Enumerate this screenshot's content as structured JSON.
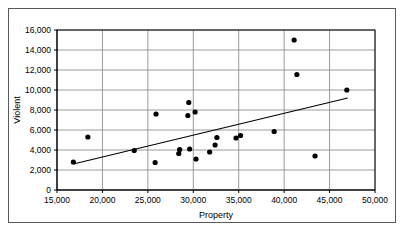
{
  "chart_data": {
    "type": "scatter",
    "title": "",
    "xlabel": "Property",
    "ylabel": "Violent",
    "xlim": [
      15000,
      50000
    ],
    "ylim": [
      0,
      16000
    ],
    "xticks": [
      15000,
      20000,
      25000,
      30000,
      35000,
      40000,
      45000,
      50000
    ],
    "yticks": [
      0,
      2000,
      4000,
      6000,
      8000,
      10000,
      12000,
      14000,
      16000
    ],
    "xtick_labels": [
      "15,000",
      "20,000",
      "25,000",
      "30,000",
      "35,000",
      "40,000",
      "45,000",
      "50,000"
    ],
    "ytick_labels": [
      "0",
      "2,000",
      "4,000",
      "6,000",
      "8,000",
      "10,000",
      "12,000",
      "14,000",
      "16,000"
    ],
    "grid": "both",
    "legend": "none",
    "marker": "filled-circle",
    "marker_color": "#000000",
    "grid_color": "#808080",
    "axis_color": "#000000",
    "points": [
      {
        "x": 16800,
        "y": 2800
      },
      {
        "x": 18400,
        "y": 5300
      },
      {
        "x": 23500,
        "y": 3950
      },
      {
        "x": 25800,
        "y": 2750
      },
      {
        "x": 25900,
        "y": 7600
      },
      {
        "x": 28400,
        "y": 3650
      },
      {
        "x": 28500,
        "y": 4050
      },
      {
        "x": 29400,
        "y": 7450
      },
      {
        "x": 29500,
        "y": 8750
      },
      {
        "x": 29600,
        "y": 4100
      },
      {
        "x": 30200,
        "y": 7800
      },
      {
        "x": 30300,
        "y": 3100
      },
      {
        "x": 31800,
        "y": 3800
      },
      {
        "x": 32400,
        "y": 4500
      },
      {
        "x": 32600,
        "y": 5250
      },
      {
        "x": 34700,
        "y": 5200
      },
      {
        "x": 35200,
        "y": 5450
      },
      {
        "x": 38900,
        "y": 5850
      },
      {
        "x": 41100,
        "y": 15000
      },
      {
        "x": 41400,
        "y": 11550
      },
      {
        "x": 43400,
        "y": 3400
      },
      {
        "x": 46900,
        "y": 10000
      }
    ],
    "trendline": {
      "type": "linear-fit",
      "x_start": 16800,
      "y_start": 2600,
      "x_end": 47000,
      "y_end": 9200,
      "color": "#000000"
    }
  }
}
